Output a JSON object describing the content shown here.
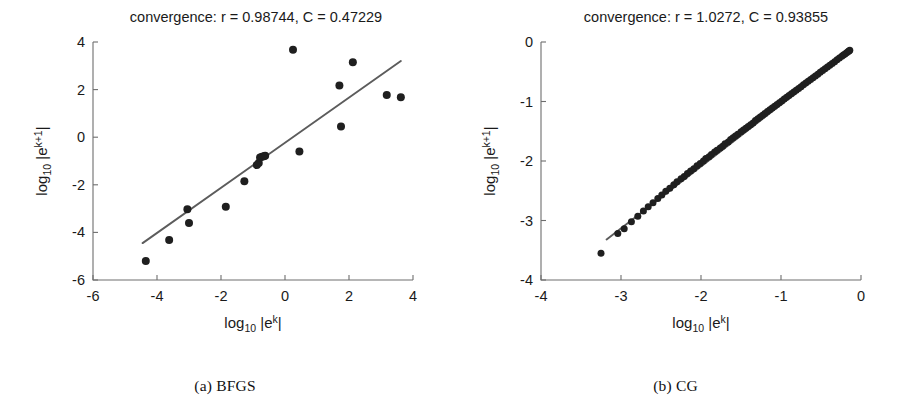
{
  "figure": {
    "panels": [
      {
        "id": "a",
        "caption": "(a) BFGS",
        "title": "convergence: r = 0.98744, C = 0.47229"
      },
      {
        "id": "b",
        "caption": "(b) CG",
        "title": "convergence: r = 1.0272, C = 0.93855"
      }
    ]
  },
  "chart_data": [
    {
      "type": "scatter",
      "panel": "a",
      "name": "BFGS",
      "title": "convergence: r = 0.98744, C = 0.47229",
      "caption": "(a) BFGS",
      "xlabel": "log_10 |e^k|",
      "ylabel": "log_10 |e^{k+1}|",
      "xlabel_parts": {
        "base": "log",
        "sub": "10",
        "body": "|e",
        "sup": "k",
        "tail": "|"
      },
      "ylabel_parts": {
        "base": "log",
        "sub": "10",
        "body": "|e",
        "sup": "k+1",
        "tail": "|"
      },
      "xlim": [
        -6,
        4
      ],
      "ylim": [
        -6,
        4
      ],
      "xticks": [
        -6,
        -4,
        -2,
        0,
        2,
        4
      ],
      "yticks": [
        -6,
        -4,
        -2,
        0,
        2,
        4
      ],
      "xticklabels": [
        "-6",
        "-4",
        "-2",
        "0",
        "2",
        "4"
      ],
      "yticklabels": [
        "-6",
        "-4",
        "-2",
        "0",
        "2",
        "4"
      ],
      "grid": false,
      "legend": "none",
      "r": 0.98744,
      "C": 0.47229,
      "points": [
        [
          -4.35,
          -5.2
        ],
        [
          -3.62,
          -4.32
        ],
        [
          -3.05,
          -3.03
        ],
        [
          -3.0,
          -3.6
        ],
        [
          -1.85,
          -2.92
        ],
        [
          -1.27,
          -1.85
        ],
        [
          -0.88,
          -1.17
        ],
        [
          -0.82,
          -1.08
        ],
        [
          -0.78,
          -0.85
        ],
        [
          -0.72,
          -0.82
        ],
        [
          -0.66,
          -0.8
        ],
        [
          -0.62,
          -0.78
        ],
        [
          0.25,
          3.67
        ],
        [
          0.45,
          -0.6
        ],
        [
          1.7,
          2.17
        ],
        [
          1.75,
          0.45
        ],
        [
          2.12,
          3.15
        ],
        [
          3.18,
          1.77
        ],
        [
          3.62,
          1.68
        ]
      ],
      "fit_line": {
        "x": [
          -4.45,
          3.62
        ],
        "y": [
          -4.45,
          3.2
        ]
      }
    },
    {
      "type": "scatter",
      "panel": "b",
      "name": "CG",
      "title": "convergence: r = 1.0272, C = 0.93855",
      "caption": "(b) CG",
      "xlabel": "log_10 |e^k|",
      "ylabel": "log_10 |e^{k+1}|",
      "xlabel_parts": {
        "base": "log",
        "sub": "10",
        "body": "|e",
        "sup": "k",
        "tail": "|"
      },
      "ylabel_parts": {
        "base": "log",
        "sub": "10",
        "body": "|e",
        "sup": "k+1",
        "tail": "|"
      },
      "xlim": [
        -4,
        0
      ],
      "ylim": [
        -4,
        0
      ],
      "xticks": [
        -4,
        -3,
        -2,
        -1,
        0
      ],
      "yticks": [
        -4,
        -3,
        -2,
        -1,
        0
      ],
      "xticklabels": [
        "-4",
        "-3",
        "-2",
        "-1",
        "0"
      ],
      "yticklabels": [
        "-4",
        "-3",
        "-2",
        "-1",
        "0"
      ],
      "grid": false,
      "legend": "none",
      "r": 1.0272,
      "C": 0.93855,
      "points": [
        [
          -3.25,
          -3.55
        ],
        [
          -3.04,
          -3.22
        ],
        [
          -2.96,
          -3.14
        ],
        [
          -2.87,
          -3.02
        ],
        [
          -2.79,
          -2.93
        ],
        [
          -2.72,
          -2.84
        ],
        [
          -2.66,
          -2.77
        ],
        [
          -2.6,
          -2.7
        ],
        [
          -2.54,
          -2.63
        ],
        [
          -2.49,
          -2.57
        ],
        [
          -2.44,
          -2.51
        ],
        [
          -2.39,
          -2.46
        ],
        [
          -2.34,
          -2.4
        ],
        [
          -2.3,
          -2.35
        ],
        [
          -2.25,
          -2.3
        ],
        [
          -2.21,
          -2.26
        ],
        [
          -2.17,
          -2.21
        ],
        [
          -2.13,
          -2.17
        ],
        [
          -2.09,
          -2.13
        ],
        [
          -2.05,
          -2.08
        ],
        [
          -2.01,
          -2.04
        ],
        [
          -1.97,
          -2.0
        ],
        [
          -1.94,
          -1.96
        ],
        [
          -1.9,
          -1.93
        ],
        [
          -1.87,
          -1.89
        ],
        [
          -1.83,
          -1.85
        ],
        [
          -1.8,
          -1.82
        ],
        [
          -1.76,
          -1.78
        ],
        [
          -1.73,
          -1.75
        ],
        [
          -1.7,
          -1.71
        ],
        [
          -1.66,
          -1.68
        ],
        [
          -1.63,
          -1.64
        ],
        [
          -1.6,
          -1.61
        ],
        [
          -1.57,
          -1.58
        ],
        [
          -1.54,
          -1.55
        ],
        [
          -1.5,
          -1.51
        ],
        [
          -1.47,
          -1.48
        ],
        [
          -1.44,
          -1.45
        ],
        [
          -1.41,
          -1.42
        ],
        [
          -1.38,
          -1.39
        ],
        [
          -1.35,
          -1.36
        ],
        [
          -1.32,
          -1.32
        ],
        [
          -1.29,
          -1.29
        ],
        [
          -1.26,
          -1.26
        ],
        [
          -1.23,
          -1.23
        ],
        [
          -1.2,
          -1.2
        ],
        [
          -1.17,
          -1.17
        ],
        [
          -1.14,
          -1.14
        ],
        [
          -1.11,
          -1.11
        ],
        [
          -1.08,
          -1.08
        ],
        [
          -1.05,
          -1.05
        ],
        [
          -1.02,
          -1.02
        ],
        [
          -0.99,
          -0.99
        ],
        [
          -0.96,
          -0.96
        ],
        [
          -0.93,
          -0.93
        ],
        [
          -0.9,
          -0.9
        ],
        [
          -0.87,
          -0.87
        ],
        [
          -0.84,
          -0.84
        ],
        [
          -0.81,
          -0.81
        ],
        [
          -0.78,
          -0.78
        ],
        [
          -0.75,
          -0.75
        ],
        [
          -0.72,
          -0.72
        ],
        [
          -0.69,
          -0.69
        ],
        [
          -0.66,
          -0.66
        ],
        [
          -0.63,
          -0.63
        ],
        [
          -0.6,
          -0.6
        ],
        [
          -0.57,
          -0.57
        ],
        [
          -0.54,
          -0.54
        ],
        [
          -0.51,
          -0.51
        ],
        [
          -0.48,
          -0.48
        ],
        [
          -0.45,
          -0.45
        ],
        [
          -0.42,
          -0.42
        ],
        [
          -0.39,
          -0.39
        ],
        [
          -0.36,
          -0.36
        ],
        [
          -0.33,
          -0.33
        ],
        [
          -0.3,
          -0.3
        ],
        [
          -0.27,
          -0.27
        ],
        [
          -0.24,
          -0.24
        ],
        [
          -0.22,
          -0.22
        ],
        [
          -0.2,
          -0.2
        ],
        [
          -0.18,
          -0.18
        ],
        [
          -0.16,
          -0.16
        ],
        [
          -0.15,
          -0.15
        ],
        [
          -0.14,
          -0.14
        ]
      ],
      "fit_line": {
        "x": [
          -3.18,
          -0.13
        ],
        "y": [
          -3.32,
          -0.15
        ]
      }
    }
  ]
}
